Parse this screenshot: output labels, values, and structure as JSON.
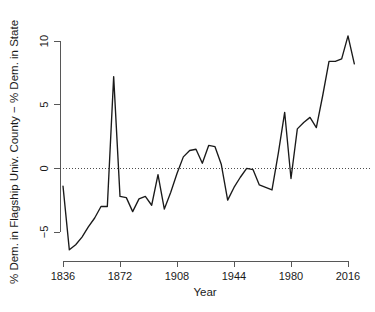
{
  "chart_data": {
    "type": "line",
    "title": "",
    "xlabel": "Year",
    "ylabel": "% Dem. in Flagship Univ. County − % Dem. in State",
    "xlim": [
      1836,
      2020
    ],
    "ylim": [
      -6.6,
      10.6
    ],
    "grid": false,
    "legend": "none",
    "x_ticks": [
      "1836",
      "1872",
      "1908",
      "1944",
      "1980",
      "2016"
    ],
    "x_tick_values": [
      1836,
      1872,
      1908,
      1944,
      1980,
      2016
    ],
    "y_ticks": [
      "10",
      "5",
      "0",
      "−5"
    ],
    "y_tick_values": [
      10,
      5,
      0,
      -5
    ],
    "annotations": [
      {
        "name": "zero-reference-line",
        "kind": "hline",
        "y": 0,
        "style": "dotted"
      }
    ],
    "series": [
      {
        "name": "% Dem. in Flagship Univ. County − % Dem. in State",
        "color": "#1a1a1a",
        "x": [
          1836,
          1840,
          1844,
          1848,
          1852,
          1856,
          1860,
          1864,
          1868,
          1872,
          1876,
          1880,
          1884,
          1888,
          1892,
          1896,
          1900,
          1904,
          1908,
          1912,
          1916,
          1920,
          1924,
          1928,
          1932,
          1936,
          1940,
          1944,
          1948,
          1952,
          1956,
          1960,
          1964,
          1968,
          1972,
          1976,
          1980,
          1984,
          1988,
          1992,
          1996,
          2000,
          2004,
          2008,
          2012,
          2016,
          2020
        ],
        "values": [
          -1.4,
          -6.4,
          -6.0,
          -5.4,
          -4.6,
          -3.9,
          -3.0,
          -3.0,
          7.2,
          -2.2,
          -2.3,
          -3.4,
          -2.4,
          -2.2,
          -2.9,
          -0.5,
          -3.2,
          -1.9,
          -0.4,
          0.9,
          1.4,
          1.5,
          0.4,
          1.8,
          1.7,
          0.3,
          -2.5,
          -1.5,
          -0.7,
          0.0,
          -0.1,
          -1.3,
          -1.5,
          -1.7,
          1.2,
          4.4,
          -0.8,
          3.1,
          3.6,
          4.0,
          3.2,
          5.7,
          8.4,
          8.4,
          8.6,
          10.4,
          8.2
        ]
      }
    ]
  },
  "axes": {
    "x_axis_name": "year-axis",
    "y_axis_name": "percent-difference-axis"
  }
}
